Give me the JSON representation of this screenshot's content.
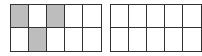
{
  "diagram": {
    "type": "ten-frames",
    "colors": {
      "shaded": "#bdbdbd",
      "empty": "#ffffff",
      "border": "#333333"
    },
    "frames": [
      {
        "rows": 2,
        "cols": 5,
        "shaded_count": 3,
        "cells": [
          [
            true,
            false,
            true,
            false,
            false
          ],
          [
            false,
            true,
            false,
            false,
            false
          ]
        ]
      },
      {
        "rows": 2,
        "cols": 5,
        "shaded_count": 0,
        "cells": [
          [
            false,
            false,
            false,
            false,
            false
          ],
          [
            false,
            false,
            false,
            false,
            false
          ]
        ]
      }
    ]
  }
}
